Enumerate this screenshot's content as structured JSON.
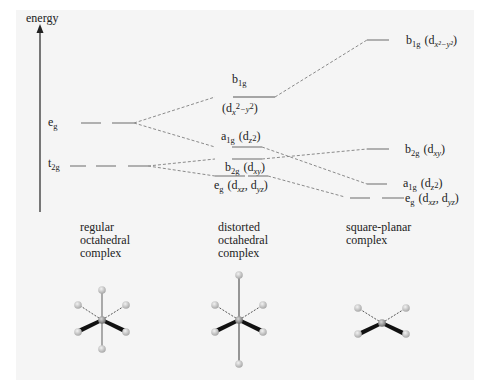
{
  "axis": {
    "label": "energy"
  },
  "levels": {
    "regular": {
      "eg": {
        "main": "e",
        "sub": "g"
      },
      "t2g": {
        "main": "t",
        "sub": "2g"
      }
    },
    "distorted": {
      "b1g": {
        "main": "b",
        "sub": "1g",
        "orbital_open": "(d",
        "orbital_sub": "x",
        "orbital_sup1": "2",
        "orbital_mid": "−y",
        "orbital_sup2": "2",
        "orbital_close": ")"
      },
      "a1g": {
        "main": "a",
        "sub": "1g",
        "orbital_open": "(d",
        "orbital_sub": "z",
        "orbital_sup": "2",
        "orbital_close": ")"
      },
      "b2g": {
        "main": "b",
        "sub": "2g",
        "orbital_open": "(d",
        "orbital_sub": "xy",
        "orbital_close": ")"
      },
      "eg": {
        "main": "e",
        "sub": "g",
        "orbital_open": "(d",
        "orbital_sub1": "xz",
        "orbital_mid": ", d",
        "orbital_sub2": "yz",
        "orbital_close": ")"
      }
    },
    "square_planar": {
      "b1g": {
        "main": "b",
        "sub": "1g",
        "orbital_open": "(d",
        "orbital_sub": "x²−y²",
        "orbital_close": ")"
      },
      "b2g": {
        "main": "b",
        "sub": "2g",
        "orbital_open": "(d",
        "orbital_sub": "xy",
        "orbital_close": ")"
      },
      "a1g": {
        "main": "a",
        "sub": "1g",
        "orbital_open": "(d",
        "orbital_sub": "z",
        "orbital_sup": "2",
        "orbital_close": ")"
      },
      "eg": {
        "main": "e",
        "sub": "g",
        "orbital_open": "(d",
        "orbital_sub1": "xz",
        "orbital_mid": ", d",
        "orbital_sub2": "yz",
        "orbital_close": ")"
      }
    }
  },
  "captions": {
    "regular": [
      "regular",
      "octahedral",
      "complex"
    ],
    "distorted": [
      "distorted",
      "octahedral",
      "complex"
    ],
    "square_planar": [
      "square-planar",
      "complex"
    ]
  },
  "colors": {
    "level_line": "#8a8a8a",
    "connector": "#8a8a8a",
    "axis": "#222222",
    "ligand": "#c8c8c8",
    "metal": "#a0a0a0"
  }
}
